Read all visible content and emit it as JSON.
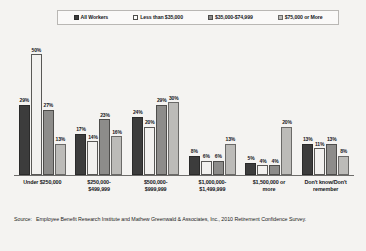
{
  "chart_data": {
    "type": "bar",
    "title": "",
    "xlabel": "",
    "ylabel": "",
    "ylim": [
      0,
      55
    ],
    "grid": false,
    "legend_position": "top",
    "categories": [
      "Under $250,000",
      "$250,000-\n$499,999",
      "$500,000-\n$999,999",
      "$1,000,000-\n$1,499,999",
      "$1,500,000 or\nmore",
      "Don't know/Don't\nremember"
    ],
    "series": [
      {
        "name": "All Workers",
        "values": [
          29,
          17,
          24,
          8,
          5,
          13
        ]
      },
      {
        "name": "Less than $35,000",
        "values": [
          50,
          14,
          20,
          6,
          4,
          11
        ]
      },
      {
        "name": "$35,000-$74,999",
        "values": [
          27,
          23,
          29,
          6,
          4,
          13
        ]
      },
      {
        "name": "$75,000 or More",
        "values": [
          13,
          16,
          30,
          13,
          20,
          8
        ]
      }
    ],
    "value_suffix": "%",
    "annotations": []
  },
  "legend": {
    "items": [
      {
        "label": "All Workers",
        "swatch": "dark-gray"
      },
      {
        "label": "Less than $35,000",
        "swatch": "white"
      },
      {
        "label": "$35,000-$74,999",
        "swatch": "medium-gray"
      },
      {
        "label": "$75,000 or More",
        "swatch": "light-gray"
      }
    ]
  },
  "colors": {
    "series_all_workers": "#3c3c3c",
    "series_less_than_35k": "#f2f1ef",
    "series_35k_74k": "#8d8c8a",
    "series_75k_or_more": "#bcbbb8",
    "background": "#f4f3f1",
    "axis": "#6d6c6a"
  },
  "source": {
    "label": "Source:",
    "text": "Employee Benefit Research Institute and Mathew Greenwald & Associates, Inc., 2010 Retirement Confidence Survey."
  }
}
